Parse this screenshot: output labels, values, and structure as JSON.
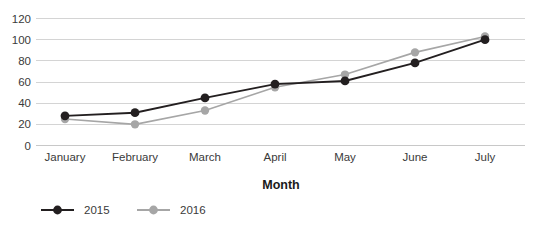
{
  "chart_data": {
    "type": "line",
    "title": "",
    "xlabel": "Month",
    "ylabel": "",
    "categories": [
      "January",
      "February",
      "March",
      "April",
      "May",
      "June",
      "July"
    ],
    "ylim": [
      0,
      120
    ],
    "yticks": [
      0,
      20,
      40,
      60,
      80,
      100,
      120
    ],
    "grid": true,
    "legend_position": "bottom-left",
    "series": [
      {
        "name": "2015",
        "color": "#231f20",
        "marker": "circle",
        "values": [
          28,
          31,
          45,
          58,
          61,
          78,
          100
        ]
      },
      {
        "name": "2016",
        "color": "#a6a6a6",
        "marker": "circle",
        "values": [
          25,
          20,
          33,
          55,
          67,
          88,
          103
        ]
      }
    ]
  },
  "axis": {
    "y_tick_labels": [
      "120",
      "100",
      "80",
      "60",
      "40",
      "20",
      "0"
    ],
    "x_tick_labels": [
      "January",
      "February",
      "March",
      "April",
      "May",
      "June",
      "July"
    ],
    "x_axis_title": "Month"
  },
  "legend": {
    "entries": [
      {
        "label": "2015",
        "color": "#231f20"
      },
      {
        "label": "2016",
        "color": "#a6a6a6"
      }
    ]
  },
  "colors": {
    "series_2015": "#231f20",
    "series_2016": "#a6a6a6",
    "gridline": "#d4d4d4",
    "text": "#3a3a3a",
    "background": "#ffffff"
  }
}
